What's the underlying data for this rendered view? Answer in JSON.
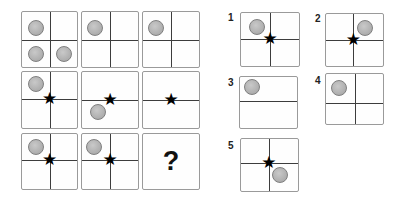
{
  "glyphs": {
    "star": "★",
    "question": "?"
  },
  "colors": {
    "border_color": "#9a9a9a",
    "line_color": "#3d3d3d",
    "circle_fill": "#b3b3b3",
    "circle_border": "#7f7f7f",
    "star_color": "#000000",
    "text_color": "#222222",
    "background": "#ffffff"
  },
  "matrix": {
    "rows": 3,
    "cols": 3,
    "cells": [
      {
        "id": "r1c1",
        "x": 21,
        "y": 11,
        "w": 57,
        "h": 57,
        "vline": true,
        "hline": true,
        "hy": 0.51,
        "shapes": [
          {
            "type": "circle",
            "cx": 0.25,
            "cy": 0.29
          },
          {
            "type": "circle",
            "cx": 0.25,
            "cy": 0.77
          },
          {
            "type": "circle",
            "cx": 0.76,
            "cy": 0.77
          }
        ]
      },
      {
        "id": "r1c2",
        "x": 81,
        "y": 11,
        "w": 58,
        "h": 57,
        "vline": true,
        "hline": true,
        "hy": 0.5,
        "shapes": [
          {
            "type": "circle",
            "cx": 0.24,
            "cy": 0.29
          }
        ]
      },
      {
        "id": "r1c3",
        "x": 142,
        "y": 11,
        "w": 58,
        "h": 57,
        "vline": true,
        "hline": true,
        "hy": 0.5,
        "shapes": [
          {
            "type": "circle",
            "cx": 0.24,
            "cy": 0.29
          }
        ]
      },
      {
        "id": "r2c1",
        "x": 21,
        "y": 71,
        "w": 57,
        "h": 58,
        "vline": true,
        "hline": true,
        "hy": 0.48,
        "shapes": [
          {
            "type": "circle",
            "cx": 0.25,
            "cy": 0.22
          },
          {
            "type": "star",
            "cx": 0.5,
            "cy": 0.48
          }
        ]
      },
      {
        "id": "r2c2",
        "x": 81,
        "y": 71,
        "w": 58,
        "h": 58,
        "vline": false,
        "hline": true,
        "hy": 0.5,
        "shapes": [
          {
            "type": "star",
            "cx": 0.5,
            "cy": 0.5
          },
          {
            "type": "circle",
            "cx": 0.29,
            "cy": 0.71
          }
        ]
      },
      {
        "id": "r2c3",
        "x": 142,
        "y": 71,
        "w": 58,
        "h": 58,
        "vline": false,
        "hline": true,
        "hy": 0.5,
        "shapes": [
          {
            "type": "star",
            "cx": 0.5,
            "cy": 0.5
          }
        ]
      },
      {
        "id": "r3c1",
        "x": 21,
        "y": 133,
        "w": 57,
        "h": 57,
        "vline": true,
        "hline": true,
        "hy": 0.48,
        "shapes": [
          {
            "type": "circle",
            "cx": 0.25,
            "cy": 0.23
          },
          {
            "type": "star",
            "cx": 0.5,
            "cy": 0.48
          }
        ]
      },
      {
        "id": "r3c2",
        "x": 81,
        "y": 133,
        "w": 58,
        "h": 57,
        "vline": true,
        "hline": true,
        "hy": 0.48,
        "shapes": [
          {
            "type": "circle",
            "cx": 0.22,
            "cy": 0.23
          },
          {
            "type": "star",
            "cx": 0.5,
            "cy": 0.48
          }
        ]
      },
      {
        "id": "r3c3",
        "x": 142,
        "y": 133,
        "w": 58,
        "h": 57,
        "vline": false,
        "hline": false,
        "shapes": [
          {
            "type": "question",
            "cx": 0.5,
            "cy": 0.5
          }
        ]
      }
    ]
  },
  "options": [
    {
      "label": "1",
      "label_x": 228,
      "label_y": 12,
      "box": {
        "x": 240,
        "y": 12,
        "w": 60,
        "h": 55,
        "vline": true,
        "hline": true,
        "hy": 0.49,
        "vx": 0.5,
        "shapes": [
          {
            "type": "circle",
            "cx": 0.27,
            "cy": 0.27
          },
          {
            "type": "star",
            "cx": 0.5,
            "cy": 0.49
          }
        ]
      }
    },
    {
      "label": "2",
      "label_x": 315,
      "label_y": 13,
      "box": {
        "x": 325,
        "y": 13,
        "w": 59,
        "h": 54,
        "vline": true,
        "hline": true,
        "hy": 0.5,
        "vx": 0.48,
        "shapes": [
          {
            "type": "circle",
            "cx": 0.69,
            "cy": 0.27
          },
          {
            "type": "star",
            "cx": 0.48,
            "cy": 0.5
          }
        ]
      }
    },
    {
      "label": "3",
      "label_x": 228,
      "label_y": 77,
      "box": {
        "x": 239,
        "y": 76,
        "w": 59,
        "h": 53,
        "vline": false,
        "hline": true,
        "hy": 0.47,
        "shapes": [
          {
            "type": "circle",
            "cx": 0.21,
            "cy": 0.19
          }
        ]
      }
    },
    {
      "label": "4",
      "label_x": 315,
      "label_y": 75,
      "box": {
        "x": 325,
        "y": 73,
        "w": 59,
        "h": 52,
        "vline": true,
        "hline": true,
        "hy": 0.57,
        "vx": 0.5,
        "shapes": [
          {
            "type": "circle",
            "cx": 0.23,
            "cy": 0.27
          }
        ]
      }
    },
    {
      "label": "5",
      "label_x": 228,
      "label_y": 140,
      "box": {
        "x": 240,
        "y": 138,
        "w": 59,
        "h": 54,
        "vline": true,
        "hline": true,
        "hy": 0.46,
        "vx": 0.49,
        "shapes": [
          {
            "type": "star",
            "cx": 0.49,
            "cy": 0.46
          },
          {
            "type": "circle",
            "cx": 0.69,
            "cy": 0.69
          }
        ]
      }
    }
  ]
}
